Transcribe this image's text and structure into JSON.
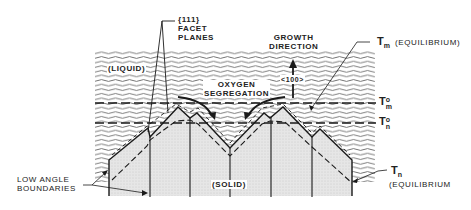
{
  "diagram": {
    "labels": {
      "facet_planes": "{111}\nFACET\nPLANES",
      "growth_direction": "GROWTH\nDIRECTION",
      "direction_index": "<100>",
      "liquid": "(LIQUID)",
      "oxygen_segregation": "OXYGEN\nSEGREGATION",
      "solid": "(SOLID)",
      "low_angle_boundaries": "LOW ANGLE\nBOUNDARIES",
      "tm_equilibrium_symbol": "T",
      "tm_equilibrium_sub": "m",
      "tm_equilibrium_text": "(EQUILIBRIUM)",
      "tm0_symbol": "T",
      "tm0_sup": "o",
      "tm0_sub": "m",
      "tn0_symbol": "T",
      "tn0_sup": "o",
      "tn0_sub": "n",
      "tn_equilibrium_symbol": "T",
      "tn_equilibrium_sub": "n",
      "tn_equilibrium_text": "(EQUILIBRIUM"
    },
    "colors": {
      "line": "#1a1a1a",
      "liquid_wave": "#555555",
      "solid_fill": "#e4e4e4",
      "background": "#ffffff"
    },
    "regions": [
      "liquid",
      "solid"
    ],
    "isotherms": [
      "T_m^o",
      "T_n^o"
    ]
  }
}
